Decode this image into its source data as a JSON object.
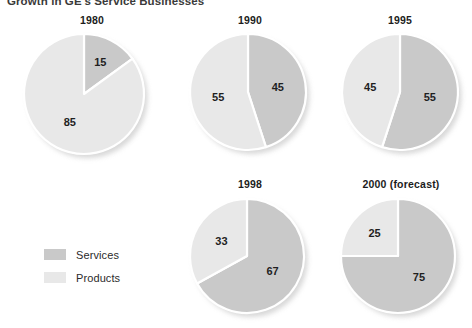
{
  "title": "Growth in GE's Service Businesses",
  "legend": {
    "items": [
      {
        "label": "Services",
        "color": "#c9c9c9"
      },
      {
        "label": "Products",
        "color": "#e8e8e8"
      }
    ]
  },
  "chart_data": {
    "type": "pie",
    "title": "Growth in GE's Service Businesses",
    "unit": "percent",
    "legend_position": "left-bottom",
    "series_names": [
      "Services",
      "Products"
    ],
    "colors": {
      "services": "#c9c9c9",
      "products": "#e8e8e8",
      "separator": "#ffffff"
    },
    "panels": [
      {
        "label": "1980",
        "values": {
          "services": 15,
          "products": 85
        },
        "value_labels": {
          "services": "15",
          "products": "85"
        }
      },
      {
        "label": "1990",
        "values": {
          "services": 45,
          "products": 55
        },
        "value_labels": {
          "services": "45",
          "products": "55"
        }
      },
      {
        "label": "1995",
        "values": {
          "services": 55,
          "products": 45
        },
        "value_labels": {
          "services": "55",
          "products": "45"
        }
      },
      {
        "label": "1998",
        "values": {
          "services": 67,
          "products": 33
        },
        "value_labels": {
          "services": "67",
          "products": "33"
        }
      },
      {
        "label": "2000 (forecast)",
        "values": {
          "services": 75,
          "products": 25
        },
        "value_labels": {
          "services": "75",
          "products": "25"
        }
      }
    ]
  }
}
